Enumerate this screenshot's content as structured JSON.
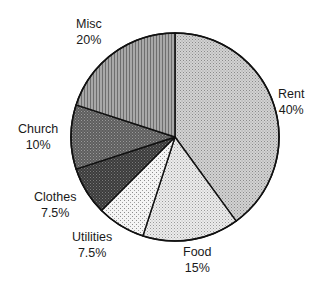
{
  "chart_data": {
    "type": "pie",
    "title": "",
    "start_angle_deg": 0,
    "direction": "clockwise",
    "categories": [
      "Rent",
      "Food",
      "Utilities",
      "Clothes",
      "Church",
      "Misc"
    ],
    "values": [
      40,
      15,
      7.5,
      7.5,
      10,
      20
    ],
    "labels": [
      "40%",
      "15%",
      "7.5%",
      "7.5%",
      "10%",
      "20%"
    ],
    "legend": "none (labels placed outside slices)",
    "slices": [
      {
        "name": "Rent",
        "value": 40,
        "label": "40%",
        "fill": "#c4c4c4",
        "pattern": "fine-crosshatch"
      },
      {
        "name": "Food",
        "value": 15,
        "label": "15%",
        "fill": "#e4e4e4",
        "pattern": "fine-dots"
      },
      {
        "name": "Utilities",
        "value": 7.5,
        "label": "7.5%",
        "fill": "#ededed",
        "pattern": "sparse-dots"
      },
      {
        "name": "Clothes",
        "value": 7.5,
        "label": "7.5%",
        "fill": "#4a4a4a",
        "pattern": "dark-dots"
      },
      {
        "name": "Church",
        "value": 10,
        "label": "10%",
        "fill": "#6c6c6c",
        "pattern": "dark-crosshatch"
      },
      {
        "name": "Misc",
        "value": 20,
        "label": "20%",
        "fill": "#9a9a9a",
        "pattern": "vertical-lines"
      }
    ]
  }
}
